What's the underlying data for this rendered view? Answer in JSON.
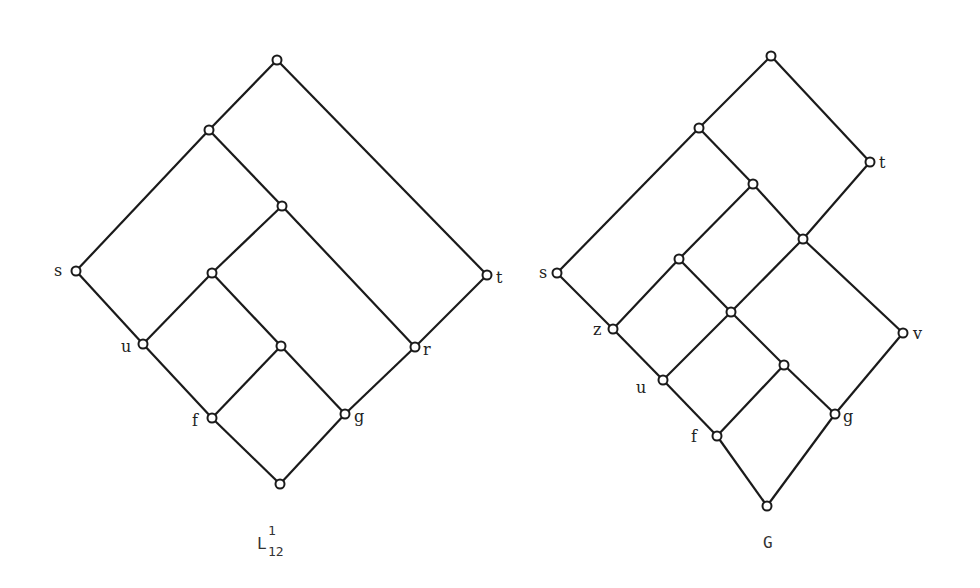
{
  "diagrams": [
    {
      "id": "left",
      "caption": {
        "main": "L",
        "sup": "1",
        "sub": "12"
      },
      "nodes": {
        "top": [
          277,
          60
        ],
        "a": [
          209,
          130
        ],
        "b": [
          282,
          206
        ],
        "s": [
          76,
          271
        ],
        "c": [
          212,
          273
        ],
        "t": [
          487,
          275
        ],
        "u": [
          143,
          344
        ],
        "d": [
          281,
          346
        ],
        "r": [
          415,
          347
        ],
        "f": [
          212,
          418
        ],
        "g": [
          345,
          414
        ],
        "bot": [
          280,
          484
        ]
      },
      "edges": [
        [
          "top",
          "a"
        ],
        [
          "top",
          "t"
        ],
        [
          "a",
          "s"
        ],
        [
          "a",
          "b"
        ],
        [
          "b",
          "c"
        ],
        [
          "b",
          "r"
        ],
        [
          "s",
          "u"
        ],
        [
          "c",
          "u"
        ],
        [
          "c",
          "d"
        ],
        [
          "t",
          "r"
        ],
        [
          "u",
          "f"
        ],
        [
          "d",
          "f"
        ],
        [
          "d",
          "g"
        ],
        [
          "r",
          "g"
        ],
        [
          "f",
          "bot"
        ],
        [
          "g",
          "bot"
        ]
      ],
      "labels": [
        {
          "node": "s",
          "text": "s",
          "dx": -22,
          "dy": 5
        },
        {
          "node": "t",
          "text": "t",
          "dx": 9,
          "dy": 8
        },
        {
          "node": "u",
          "text": "u",
          "dx": -22,
          "dy": 8
        },
        {
          "node": "r",
          "text": "r",
          "dx": 8,
          "dy": 8
        },
        {
          "node": "f",
          "text": "f",
          "dx": -20,
          "dy": 8
        },
        {
          "node": "g",
          "text": "g",
          "dx": 9,
          "dy": 8
        }
      ]
    },
    {
      "id": "right",
      "caption": {
        "main": "G"
      },
      "nodes": {
        "top": [
          771,
          56
        ],
        "a": [
          699,
          128
        ],
        "t": [
          870,
          162
        ],
        "b": [
          753,
          184
        ],
        "c": [
          803,
          239
        ],
        "s": [
          557,
          273
        ],
        "d": [
          679,
          259
        ],
        "e": [
          731,
          312
        ],
        "z": [
          613,
          329
        ],
        "v": [
          903,
          333
        ],
        "h": [
          784,
          365
        ],
        "u": [
          663,
          380
        ],
        "g": [
          835,
          414
        ],
        "f": [
          717,
          436
        ],
        "bot": [
          767,
          506
        ]
      },
      "edges": [
        [
          "top",
          "a"
        ],
        [
          "top",
          "t"
        ],
        [
          "a",
          "s"
        ],
        [
          "a",
          "b"
        ],
        [
          "b",
          "d"
        ],
        [
          "b",
          "c"
        ],
        [
          "t",
          "c"
        ],
        [
          "s",
          "z"
        ],
        [
          "d",
          "z"
        ],
        [
          "d",
          "e"
        ],
        [
          "c",
          "e"
        ],
        [
          "c",
          "v"
        ],
        [
          "z",
          "u"
        ],
        [
          "e",
          "u"
        ],
        [
          "e",
          "h"
        ],
        [
          "u",
          "f"
        ],
        [
          "h",
          "f"
        ],
        [
          "h",
          "g"
        ],
        [
          "v",
          "g"
        ],
        [
          "f",
          "bot"
        ],
        [
          "g",
          "bot"
        ]
      ],
      "labels": [
        {
          "node": "s",
          "text": "s",
          "dx": -18,
          "dy": 5
        },
        {
          "node": "t",
          "text": "t",
          "dx": 9,
          "dy": 6
        },
        {
          "node": "z",
          "text": "z",
          "dx": -20,
          "dy": 6
        },
        {
          "node": "v",
          "text": "v",
          "dx": 10,
          "dy": 6
        },
        {
          "node": "u",
          "text": "u",
          "dx": -27,
          "dy": 13
        },
        {
          "node": "f",
          "text": "f",
          "dx": -26,
          "dy": 6
        },
        {
          "node": "g",
          "text": "g",
          "dx": 8,
          "dy": 8
        }
      ]
    }
  ]
}
